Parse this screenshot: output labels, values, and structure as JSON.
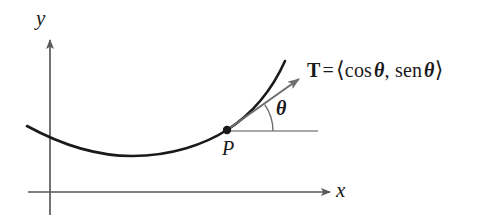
{
  "figure": {
    "background_color": "#ffffff",
    "width": 479,
    "height": 217
  },
  "axes": {
    "x_label": "x",
    "y_label": "y",
    "axis_color": "#5a5a5a",
    "origin": {
      "x": 50,
      "y": 192
    },
    "x_axis": {
      "start_x": 28,
      "end_x": 332,
      "y": 192
    },
    "y_axis": {
      "x": 50,
      "start_y": 215,
      "end_y": 38
    }
  },
  "curve": {
    "name": "parabola-curve",
    "color": "#1a1a1a",
    "stroke_width": 2.6,
    "start": {
      "x": 27,
      "y": 126
    },
    "vertex": {
      "x": 132,
      "y": 156
    },
    "end": {
      "x": 285,
      "y": 61
    }
  },
  "point": {
    "label": "P",
    "x": 227,
    "y": 130,
    "dot_radius": 4.2,
    "dot_color": "#1a1a1a"
  },
  "tangent_vector": {
    "label_vector_name": "T",
    "label_equals": "=",
    "label_open_bracket": "⟨",
    "label_cos": "cos",
    "label_theta_1": "θ",
    "label_comma": ",",
    "label_sen": "sen",
    "label_theta_2": "θ",
    "label_close_bracket": "⟩",
    "full_text": "T = ⟨cos θ, sen θ⟩",
    "color": "#6e6e6e",
    "tail": {
      "x": 227,
      "y": 130
    },
    "tip": {
      "x": 301,
      "y": 78
    },
    "angle_degrees": 35
  },
  "reference_line": {
    "name": "horizontal-reference-line",
    "color": "#8c8c8c",
    "start": {
      "x": 227,
      "y": 131
    },
    "end": {
      "x": 318,
      "y": 131
    }
  },
  "angle_arc": {
    "label": "θ",
    "color": "#6e6e6e",
    "radius": 46,
    "start_degrees": 0,
    "end_degrees": 35,
    "center": {
      "x": 227,
      "y": 130
    }
  }
}
